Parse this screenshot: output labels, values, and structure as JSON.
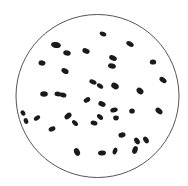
{
  "diagram": {
    "type": "microscope-field",
    "background": "#ffffff",
    "field": {
      "cx": 97.5,
      "cy": 96,
      "r": 81.5,
      "stroke": "#555555",
      "stroke_width": 1
    },
    "particle_color": "#1a1a1a",
    "particles": [
      {
        "cx": 103,
        "cy": 34,
        "rx": 3.5,
        "ry": 2.2,
        "angle": 25
      },
      {
        "cx": 56,
        "cy": 45,
        "rx": 5,
        "ry": 3,
        "angle": 10
      },
      {
        "cx": 67,
        "cy": 53,
        "rx": 3.8,
        "ry": 2.6,
        "angle": 15
      },
      {
        "cx": 86,
        "cy": 51,
        "rx": 3.8,
        "ry": 2.6,
        "angle": 25
      },
      {
        "cx": 130,
        "cy": 44,
        "rx": 4,
        "ry": 2.4,
        "angle": 30
      },
      {
        "cx": 42,
        "cy": 63,
        "rx": 3.5,
        "ry": 2.6,
        "angle": 10
      },
      {
        "cx": 65,
        "cy": 71,
        "rx": 3.8,
        "ry": 2.6,
        "angle": 30
      },
      {
        "cx": 113,
        "cy": 58,
        "rx": 4,
        "ry": 2.6,
        "angle": 25
      },
      {
        "cx": 112,
        "cy": 66,
        "rx": 4,
        "ry": 2.6,
        "angle": 15
      },
      {
        "cx": 153,
        "cy": 62,
        "rx": 3.2,
        "ry": 2.6,
        "angle": 0
      },
      {
        "cx": 163,
        "cy": 80,
        "rx": 4,
        "ry": 2.4,
        "angle": 35
      },
      {
        "cx": 93,
        "cy": 82,
        "rx": 3.8,
        "ry": 2.2,
        "angle": 25
      },
      {
        "cx": 100,
        "cy": 86,
        "rx": 3.5,
        "ry": 2.2,
        "angle": 35
      },
      {
        "cx": 115,
        "cy": 86,
        "rx": 4,
        "ry": 3,
        "angle": 30
      },
      {
        "cx": 140,
        "cy": 91,
        "rx": 3.8,
        "ry": 2.8,
        "angle": 40
      },
      {
        "cx": 44,
        "cy": 94,
        "rx": 3.8,
        "ry": 2.8,
        "angle": 0
      },
      {
        "cx": 58,
        "cy": 94,
        "rx": 3.5,
        "ry": 2.4,
        "angle": 10
      },
      {
        "cx": 63,
        "cy": 95,
        "rx": 3.5,
        "ry": 2.4,
        "angle": 15
      },
      {
        "cx": 87,
        "cy": 100,
        "rx": 3.5,
        "ry": 2.4,
        "angle": -30
      },
      {
        "cx": 102,
        "cy": 104,
        "rx": 3.8,
        "ry": 2.6,
        "angle": 25
      },
      {
        "cx": 114,
        "cy": 110,
        "rx": 3.8,
        "ry": 2.4,
        "angle": -15
      },
      {
        "cx": 132,
        "cy": 111,
        "rx": 2.8,
        "ry": 2.6,
        "angle": 0
      },
      {
        "cx": 159,
        "cy": 111,
        "rx": 4,
        "ry": 2.6,
        "angle": 40
      },
      {
        "cx": 23,
        "cy": 113,
        "rx": 2.8,
        "ry": 2.2,
        "angle": 60
      },
      {
        "cx": 26,
        "cy": 121,
        "rx": 3,
        "ry": 2.2,
        "angle": 70
      },
      {
        "cx": 37,
        "cy": 118,
        "rx": 3.5,
        "ry": 2.2,
        "angle": -35
      },
      {
        "cx": 68,
        "cy": 116,
        "rx": 4,
        "ry": 2.6,
        "angle": -40
      },
      {
        "cx": 75,
        "cy": 123,
        "rx": 3.5,
        "ry": 2.2,
        "angle": 45
      },
      {
        "cx": 94,
        "cy": 123,
        "rx": 3.5,
        "ry": 2.4,
        "angle": 15
      },
      {
        "cx": 100,
        "cy": 117,
        "rx": 3.5,
        "ry": 2.2,
        "angle": 40
      },
      {
        "cx": 116,
        "cy": 118,
        "rx": 2.8,
        "ry": 2.4,
        "angle": 0
      },
      {
        "cx": 52,
        "cy": 129,
        "rx": 3.5,
        "ry": 2.4,
        "angle": -20
      },
      {
        "cx": 122,
        "cy": 135,
        "rx": 3.6,
        "ry": 2.6,
        "angle": -10
      },
      {
        "cx": 137,
        "cy": 141,
        "rx": 3.6,
        "ry": 2.4,
        "angle": 55
      },
      {
        "cx": 146,
        "cy": 140,
        "rx": 3.6,
        "ry": 2.4,
        "angle": 55
      },
      {
        "cx": 77,
        "cy": 152,
        "rx": 4,
        "ry": 2.8,
        "angle": 65
      },
      {
        "cx": 102,
        "cy": 153,
        "rx": 4,
        "ry": 2.4,
        "angle": -5
      },
      {
        "cx": 115,
        "cy": 151,
        "rx": 3.5,
        "ry": 2.2,
        "angle": -70
      },
      {
        "cx": 135,
        "cy": 150,
        "rx": 4,
        "ry": 2.6,
        "angle": -70
      }
    ],
    "particle_count": 39
  }
}
